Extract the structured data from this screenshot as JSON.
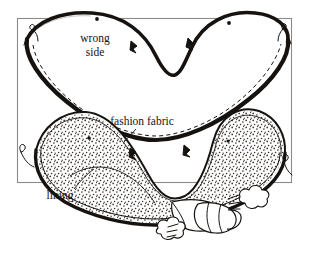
{
  "figure": {
    "kind": "sewing-instruction-illustration",
    "title_visible": false,
    "background_color": "#ffffff",
    "ink_color": "#16120f",
    "frame_color": "#8a8a8a",
    "stipple_color": "#3a3430",
    "frame": {
      "x": 17,
      "y": 18,
      "width": 275,
      "height": 165
    },
    "labels": {
      "wrong_side_line1": "wrong",
      "wrong_side_line2": "side",
      "fashion_fabric": "fashion fabric",
      "lining": "lining"
    },
    "caption": {
      "partial_cut_off_text": ""
    },
    "elements": {
      "upper_piece_name": "upper-fabric-piece",
      "lower_piece_name": "lower-assembled-piece",
      "iron_name": "iron",
      "steam_name": "steam-puffs",
      "dashed_line_name": "stitching-line",
      "notch_name": "notch-mark",
      "dot_name": "dot-mark",
      "thread_name": "thread-tail"
    },
    "counts": {
      "dot_marks_upper": 2,
      "notch_marks_upper": 2,
      "notch_marks_lower": 2,
      "thread_tails": 4,
      "steam_puffs": 2
    }
  }
}
